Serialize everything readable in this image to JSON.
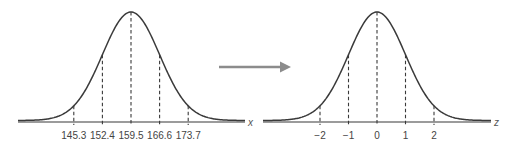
{
  "figure": {
    "left_curve": {
      "axis_label": "x",
      "mean": 159.5,
      "sd": 7.1,
      "ticks": [
        "145.3",
        "152.4",
        "159.5",
        "166.6",
        "173.7"
      ]
    },
    "arrow": {
      "direction": "right",
      "color": "#8c8c8c"
    },
    "right_curve": {
      "axis_label": "z",
      "mean": 0,
      "sd": 1,
      "ticks": [
        "−2",
        "−1",
        "0",
        "1",
        "2"
      ]
    },
    "colors": {
      "curve": "#3a3a3a",
      "axis": "#7a7a7a",
      "dash": "#3a3a3a",
      "label": "#444444"
    }
  },
  "chart_data": [
    {
      "type": "line",
      "title": "",
      "xlabel": "x",
      "ylabel": "",
      "x": [
        145.3,
        152.4,
        159.5,
        166.6,
        173.7
      ],
      "tick_labels": [
        "145.3",
        "152.4",
        "159.5",
        "166.6",
        "173.7"
      ],
      "series": [
        {
          "name": "Normal density (mean 159.5, sd 7.1)",
          "mean": 159.5,
          "sd": 7.1
        }
      ],
      "grid": false
    },
    {
      "type": "line",
      "title": "",
      "xlabel": "z",
      "ylabel": "",
      "x": [
        -2,
        -1,
        0,
        1,
        2
      ],
      "tick_labels": [
        "−2",
        "−1",
        "0",
        "1",
        "2"
      ],
      "series": [
        {
          "name": "Standard normal density (mean 0, sd 1)",
          "mean": 0,
          "sd": 1
        }
      ],
      "grid": false
    }
  ]
}
